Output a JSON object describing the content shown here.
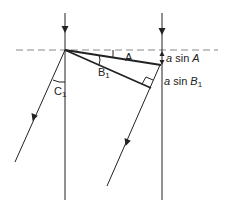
{
  "diagram": {
    "colors": {
      "line": "#222222",
      "dashed": "#888888",
      "background": "#ffffff"
    },
    "labels": {
      "angle_A": "A",
      "angle_B1_main": "B",
      "angle_B1_sub": "1",
      "angle_C1_main": "C",
      "angle_C1_sub": "1",
      "a_sin_A_prefix": "a",
      "a_sin_A_fn": " sin ",
      "a_sin_A_var": "A",
      "a_sin_B1_prefix": "a",
      "a_sin_B1_fn": " sin ",
      "a_sin_B1_var": "B",
      "a_sin_B1_sub": "1"
    },
    "elements": [
      "boundary-dashed-line",
      "left-incident-ray",
      "right-incident-ray",
      "wavefront-A-line",
      "wavefront-B1-line",
      "refracted-ray-C1",
      "refracted-ray-B1",
      "right-angle-marker",
      "a-sin-A-dimension"
    ]
  }
}
